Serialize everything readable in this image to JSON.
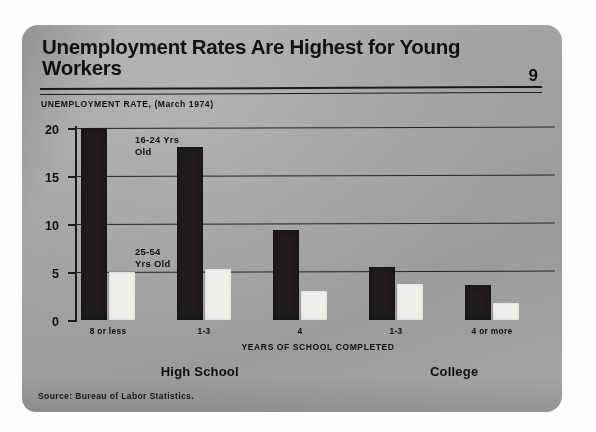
{
  "header": {
    "title": "Unemployment Rates Are Highest for Young Workers",
    "page_number": "9",
    "subtitle": "UNEMPLOYMENT RATE, (March 1974)"
  },
  "footer": {
    "source": "Source: Bureau of Labor Statistics."
  },
  "legend": {
    "young_label": "16-24 Yrs\nOld",
    "prime_label": "25-54\nYrs Old"
  },
  "groups": [
    {
      "label": "High School",
      "center_pct": 26
    },
    {
      "label": "College",
      "center_pct": 79
    }
  ],
  "chart_data": {
    "type": "bar",
    "title": "Unemployment Rates Are Highest for Young Workers",
    "subtitle": "UNEMPLOYMENT RATE, (March 1974)",
    "xlabel": "YEARS OF SCHOOL COMPLETED",
    "ylabel": "UNEMPLOYMENT RATE",
    "ylim": [
      0,
      20
    ],
    "yticks": [
      0,
      5,
      10,
      15,
      20
    ],
    "ytick_labels": [
      "0",
      "5",
      "10",
      "15",
      "20"
    ],
    "grid": true,
    "legend_position": "inside-plot",
    "categories": [
      "8 or less",
      "1-3",
      "4",
      "1-3",
      "4 or more"
    ],
    "category_groups": [
      "High School",
      "High School",
      "High School",
      "College",
      "College"
    ],
    "series": [
      {
        "name": "16-24 Yrs Old",
        "color": "#241c1c",
        "values": [
          20.0,
          18.0,
          9.4,
          5.5,
          3.6
        ]
      },
      {
        "name": "25-54 Yrs Old",
        "color": "#f4f3ee",
        "values": [
          5.0,
          5.3,
          3.0,
          3.8,
          1.8
        ]
      }
    ],
    "source": "Source: Bureau of Labor Statistics."
  }
}
